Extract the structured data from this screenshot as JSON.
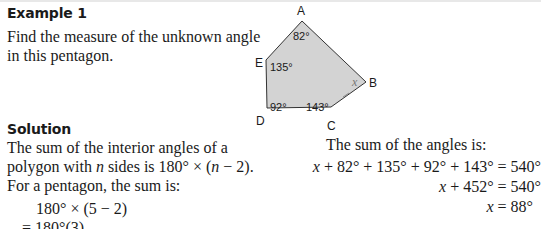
{
  "example": {
    "heading": "Example 1",
    "prompt_line1": "Find the measure of the unknown angle",
    "prompt_line2": "in this pentagon."
  },
  "diagram": {
    "shape": "pentagon",
    "fill_color": "#d3d3d3",
    "stroke_color": "#333333",
    "vertices": {
      "A": {
        "label": "A",
        "angle": "82°"
      },
      "B": {
        "label": "B",
        "angle": "x"
      },
      "C": {
        "label": "C",
        "angle": "143°"
      },
      "D": {
        "label": "D",
        "angle": "92°"
      },
      "E": {
        "label": "E",
        "angle": "135°"
      }
    }
  },
  "solution": {
    "heading": "Solution",
    "line1": "The sum of the interior angles of a",
    "line2_pre": "polygon with ",
    "line2_var": "n",
    "line2_mid": " sides is 180° × (",
    "line2_var2": "n",
    "line2_post": " − 2).",
    "line3": "For a pentagon, the sum is:",
    "calc1": "180° × (5 − 2)",
    "calc2": "= 180°(3)"
  },
  "sum": {
    "intro": "The sum of the angles is:",
    "eq1_var": "x",
    "eq1_rest": " + 82° + 135° + 92° + 143° = 540°",
    "eq2_var": "x",
    "eq2_rest": " + 452° = 540°",
    "eq3_var": "x",
    "eq3_rest": " = 88°"
  }
}
